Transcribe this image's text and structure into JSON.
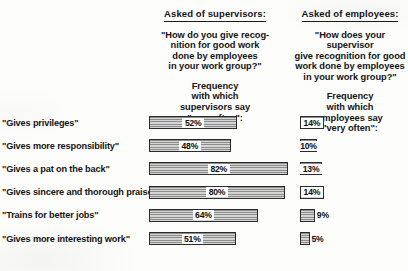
{
  "panels": {
    "supervisors": {
      "asked_of": "Asked of supervisors:",
      "question": "\"How do you give  recog-\nnition for good work\ndone by employees\nin your work group?\"",
      "frequency_caption": "Frequency\nwith which\nsupervisors say\n\"very often\":"
    },
    "employees": {
      "asked_of": "Asked of employees:",
      "question": "\"How does your supervisor\ngive recognition for good\nwork done by employees\nin your work group?\"",
      "frequency_caption": "Frequency\nwith which\nemployees say\n\"very often\":"
    }
  },
  "chart_data": {
    "type": "bar",
    "orientation": "horizontal",
    "xlabel": "",
    "ylabel": "",
    "xlim": [
      0,
      100
    ],
    "grid": false,
    "legend_position": "none",
    "units": "percent",
    "categories": [
      "\"Gives privileges\"",
      "\"Gives more responsibility\"",
      "\"Gives a pat on the back\"",
      "\"Gives sincere and thorough praise\"",
      "\"Trains for better jobs\"",
      "\"Gives more interesting work\""
    ],
    "series": [
      {
        "name": "Supervisors say \"very often\"",
        "values": [
          52,
          48,
          82,
          80,
          64,
          51
        ],
        "labels": [
          "52%",
          "48%",
          "82%",
          "80%",
          "64%",
          "51%"
        ]
      },
      {
        "name": "Employees say \"very often\"",
        "values": [
          14,
          10,
          13,
          14,
          9,
          5
        ],
        "labels": [
          "14%",
          "10%",
          "13%",
          "14%",
          "9%",
          "5%"
        ]
      }
    ]
  },
  "colors": {
    "background": "#fdfdfc",
    "text": "#141414",
    "bar_fill": "#b9b9b9",
    "bar_hatch_dark": "#8c8c8c",
    "bar_hatch_light": "#d5d5d5",
    "bar_border": "#2b2b2b"
  }
}
